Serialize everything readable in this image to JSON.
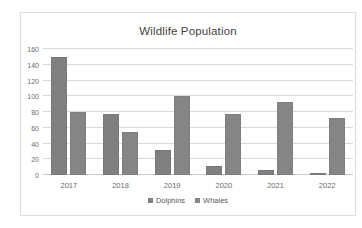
{
  "chart_data": {
    "type": "bar",
    "title": "Wildlife Population",
    "xlabel": "",
    "ylabel": "",
    "categories": [
      "2017",
      "2018",
      "2019",
      "2020",
      "2021",
      "2022"
    ],
    "series": [
      {
        "name": "Dolphins",
        "color": "#808080",
        "values": [
          150,
          78,
          32,
          12,
          6,
          2
        ]
      },
      {
        "name": "Whales",
        "color": "#858585",
        "values": [
          80,
          54,
          100,
          77,
          93,
          72
        ]
      }
    ],
    "ylim": [
      0,
      160
    ],
    "yticks": [
      0,
      20,
      40,
      60,
      80,
      100,
      120,
      140,
      160
    ],
    "ytick_labels": [
      "0",
      "20",
      "40",
      "60",
      "80",
      "100",
      "120",
      "140",
      "160"
    ],
    "grid": true,
    "legend_position": "bottom",
    "border_color": "#dedede",
    "gridline_color": "#d9d9d9",
    "text_color": "#6a6a6a"
  }
}
